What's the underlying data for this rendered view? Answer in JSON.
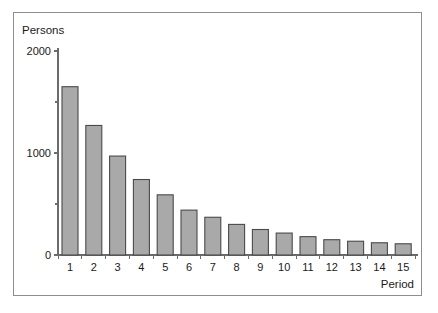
{
  "chart_data": {
    "type": "bar",
    "title": "",
    "subtitle": "",
    "xlabel": "Period",
    "ylabel": "Persons",
    "categories": [
      "1",
      "2",
      "3",
      "4",
      "5",
      "6",
      "7",
      "8",
      "9",
      "10",
      "11",
      "12",
      "13",
      "14",
      "15"
    ],
    "values": [
      1650,
      1270,
      970,
      740,
      590,
      440,
      370,
      300,
      250,
      215,
      180,
      150,
      135,
      120,
      110
    ],
    "series": [
      {
        "name": "Persons",
        "values": [
          1650,
          1270,
          970,
          740,
          590,
          440,
          370,
          300,
          250,
          215,
          180,
          150,
          135,
          120,
          110
        ]
      }
    ],
    "ylim": [
      0,
      2000
    ],
    "y_ticks_labeled": [
      "0",
      "1000",
      "2000"
    ],
    "y_tick_values_labeled": [
      0,
      1000,
      2000
    ],
    "y_tick_values_minor": [
      500,
      1500
    ],
    "y_tick_interval_minor": 500,
    "x_tick_labels": [
      "1",
      "2",
      "3",
      "4",
      "5",
      "6",
      "7",
      "8",
      "9",
      "10",
      "11",
      "12",
      "13",
      "14",
      "15"
    ],
    "grid": false,
    "legend": false,
    "legend_position": "none",
    "bar_fill_color": "#a9a9a9",
    "bar_border_color": "#4a4a4a",
    "axis_color": "#6b6b6b",
    "text_color": "#1a1a1a",
    "background_color": "#ffffff",
    "frame_border_color": "#8e8e8e",
    "annotations": []
  },
  "figure": {
    "y_axis_title": "Persons",
    "x_axis_title": "Period"
  }
}
